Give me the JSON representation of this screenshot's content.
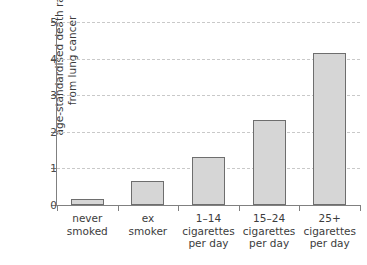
{
  "chart_data": {
    "type": "bar",
    "title": "",
    "xlabel": "",
    "ylabel_line1": "age-standardised death rate",
    "ylabel_line2": "from lung cancer",
    "categories": [
      "never\nsmoked",
      "ex\nsmoker",
      "1–14\ncigarettes\nper day",
      "15–24\ncigarettes\nper day",
      "25+\ncigarettes\nper day"
    ],
    "category_lines": [
      [
        "never",
        "smoked"
      ],
      [
        "ex",
        "smoker"
      ],
      [
        "1–14",
        "cigarettes",
        "per day"
      ],
      [
        "15–24",
        "cigarettes",
        "per day"
      ],
      [
        "25+",
        "cigarettes",
        "per day"
      ]
    ],
    "values": [
      0.17,
      0.66,
      1.3,
      2.32,
      4.15
    ],
    "ylim": [
      0,
      5
    ],
    "ytick_labels": [
      "0",
      "1",
      "2",
      "3",
      "4",
      "5"
    ],
    "ytick_values": [
      0,
      1,
      2,
      3,
      4,
      5
    ],
    "grid": true,
    "grid_axis": "y",
    "legend": "none",
    "bar_fill": "#d6d6d6",
    "bar_edge": "#6e6e6e",
    "grid_color": "#c9c9c9",
    "axis_color": "#808080"
  },
  "axis": {
    "y_title_line1": "age-standardised death rate",
    "y_title_line2": "from lung cancer"
  }
}
